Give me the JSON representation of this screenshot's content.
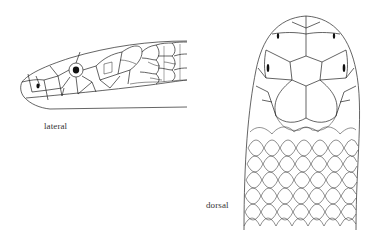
{
  "figure": {
    "views": [
      {
        "id": "lateral",
        "label": "lateral"
      },
      {
        "id": "dorsal",
        "label": "dorsal"
      }
    ]
  },
  "colors": {
    "line": "#222222",
    "eye": "#111111",
    "label": "#333333",
    "background": "#ffffff"
  }
}
